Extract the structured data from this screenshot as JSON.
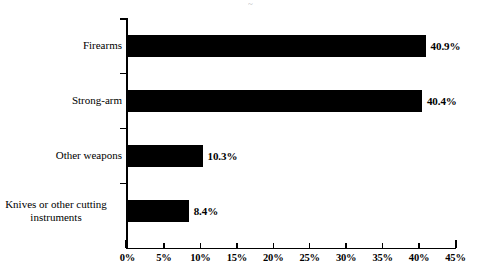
{
  "chart_data": {
    "type": "bar",
    "orientation": "horizontal",
    "title": "",
    "subtitle": "",
    "xlabel": "",
    "ylabel": "",
    "categories": [
      "Firearms",
      "Strong-arm",
      "Other weapons",
      "Knives or other cutting\ninstruments"
    ],
    "values": [
      40.9,
      40.4,
      10.3,
      8.4
    ],
    "value_labels": [
      "40.9%",
      "40.4%",
      "10.3%",
      "8.4%"
    ],
    "xlim": [
      0,
      45
    ],
    "xticks": [
      0,
      5,
      10,
      15,
      20,
      25,
      30,
      35,
      40,
      45
    ],
    "xtick_labels": [
      "0%",
      "5%",
      "10%",
      "15%",
      "20%",
      "25%",
      "30%",
      "35%",
      "40%",
      "45%"
    ],
    "grid": false,
    "legend": null,
    "bar_color": "#000000",
    "axis_color": "#000000",
    "background_color": "#ffffff"
  },
  "artifact": {
    "top_smudge": "~"
  }
}
